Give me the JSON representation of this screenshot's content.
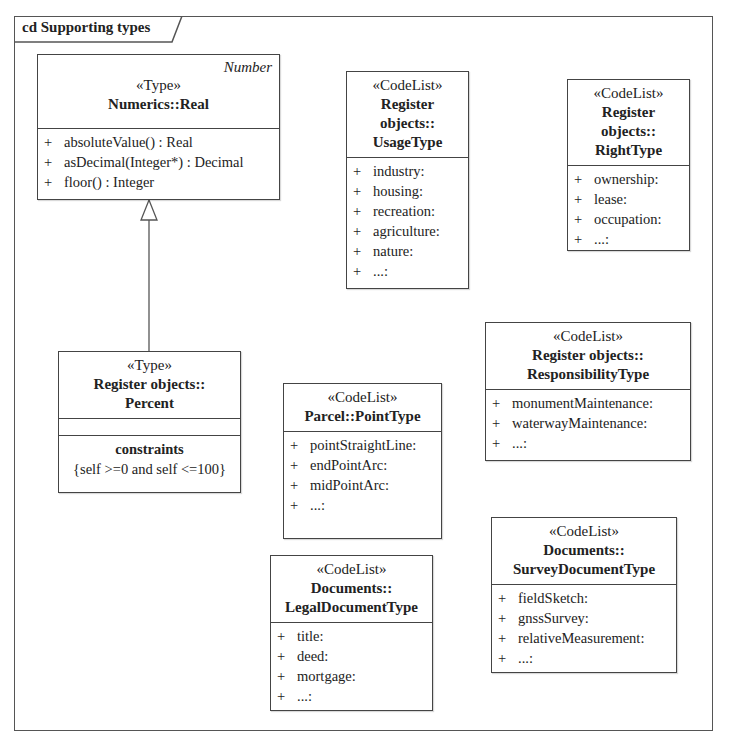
{
  "frame": {
    "title": "cd Supporting types"
  },
  "classes": {
    "real": {
      "corner": "Number",
      "stereotype": "«Type»",
      "name": "Numerics::Real",
      "operations": [
        {
          "vis": "+",
          "text": "absoluteValue() : Real"
        },
        {
          "vis": "+",
          "text": "asDecimal(Integer*) : Decimal"
        },
        {
          "vis": "+",
          "text": "floor() : Integer"
        }
      ]
    },
    "percent": {
      "stereotype": "«Type»",
      "name_line1": "Register objects::",
      "name_line2": "Percent",
      "constraints_title": "constraints",
      "constraint": "{self >=0 and self <=100}"
    },
    "usage": {
      "stereotype": "«CodeList»",
      "name_line1": "Register",
      "name_line2": "objects::",
      "name_line3": "UsageType",
      "values": [
        {
          "vis": "+",
          "text": "industry:"
        },
        {
          "vis": "+",
          "text": "housing:"
        },
        {
          "vis": "+",
          "text": "recreation:"
        },
        {
          "vis": "+",
          "text": "agriculture:"
        },
        {
          "vis": "+",
          "text": "nature:"
        },
        {
          "vis": "+",
          "text": "...:"
        }
      ]
    },
    "right": {
      "stereotype": "«CodeList»",
      "name_line1": "Register",
      "name_line2": "objects::",
      "name_line3": "RightType",
      "values": [
        {
          "vis": "+",
          "text": "ownership:"
        },
        {
          "vis": "+",
          "text": "lease:"
        },
        {
          "vis": "+",
          "text": "occupation:"
        },
        {
          "vis": "+",
          "text": "...:"
        }
      ]
    },
    "responsibility": {
      "stereotype": "«CodeList»",
      "name_line1": "Register objects::",
      "name_line2": "ResponsibilityType",
      "values": [
        {
          "vis": "+",
          "text": "monumentMaintenance:"
        },
        {
          "vis": "+",
          "text": "waterwayMaintenance:"
        },
        {
          "vis": "+",
          "text": "...:"
        }
      ]
    },
    "point": {
      "stereotype": "«CodeList»",
      "name_line1": "Parcel::PointType",
      "values": [
        {
          "vis": "+",
          "text": "pointStraightLine:"
        },
        {
          "vis": "+",
          "text": "endPointArc:"
        },
        {
          "vis": "+",
          "text": "midPointArc:"
        },
        {
          "vis": "+",
          "text": "...:"
        }
      ]
    },
    "legal": {
      "stereotype": "«CodeList»",
      "name_line1": "Documents::",
      "name_line2": "LegalDocumentType",
      "values": [
        {
          "vis": "+",
          "text": "title:"
        },
        {
          "vis": "+",
          "text": "deed:"
        },
        {
          "vis": "+",
          "text": "mortgage:"
        },
        {
          "vis": "+",
          "text": "...:"
        }
      ]
    },
    "survey": {
      "stereotype": "«CodeList»",
      "name_line1": "Documents::",
      "name_line2": "SurveyDocumentType",
      "values": [
        {
          "vis": "+",
          "text": "fieldSketch:"
        },
        {
          "vis": "+",
          "text": "gnssSurvey:"
        },
        {
          "vis": "+",
          "text": "relativeMeasurement:"
        },
        {
          "vis": "+",
          "text": "...:"
        }
      ]
    }
  },
  "relations": [
    {
      "type": "generalization",
      "from": "Register objects::Percent",
      "to": "Numerics::Real"
    }
  ]
}
